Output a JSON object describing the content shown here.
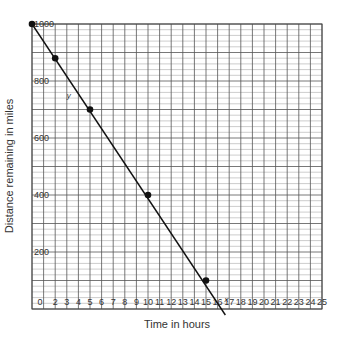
{
  "chart_data": {
    "type": "line",
    "title": "",
    "xlabel": "Time in hours",
    "ylabel": "Distance remaining in miles",
    "xlim": [
      0,
      25
    ],
    "ylim": [
      0,
      1000
    ],
    "grid": true,
    "x_ticks": [
      "0",
      "1",
      "2",
      "3",
      "4",
      "5",
      "6",
      "7",
      "8",
      "9",
      "10",
      "11",
      "12",
      "13",
      "14",
      "15",
      "16",
      "17",
      "18",
      "19",
      "20",
      "21",
      "22",
      "23",
      "24",
      "25"
    ],
    "y_ticks": [
      "200",
      "400",
      "600",
      "800",
      "1000"
    ],
    "series": [
      {
        "name": "distance",
        "points": [
          {
            "x": 0,
            "y": 1000
          },
          {
            "x": 2,
            "y": 880
          },
          {
            "x": 5,
            "y": 700
          },
          {
            "x": 10,
            "y": 400
          },
          {
            "x": 15,
            "y": 100
          }
        ],
        "line": {
          "x0": 0,
          "y0": 1000,
          "x1": 16.67,
          "y1": 0
        }
      }
    ],
    "annotations": [
      {
        "text": "y",
        "x": 3,
        "y": 740
      },
      {
        "text": "x",
        "x": 16.6,
        "y": 25
      }
    ],
    "legend": null
  },
  "colors": {
    "grid_major": "#555555",
    "grid_minor": "#9a9a9a",
    "line": "#111111",
    "text": "#333333"
  }
}
